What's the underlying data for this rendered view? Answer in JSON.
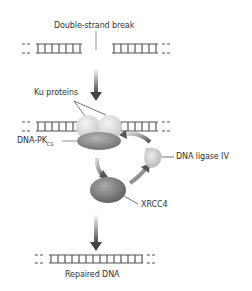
{
  "labels": {
    "break": "Double-strand break",
    "ku": "Ku proteins",
    "dnapk": "DNA-PK",
    "dnapk_sub": "CS",
    "ligase": "DNA ligase IV",
    "xrcc4": "XRCC4",
    "repaired": "Repaired DNA"
  },
  "colors": {
    "strand": "#555555",
    "ku": "#d6d6d6",
    "dnapk": "#8a8a8a",
    "xrcc4": "#7d7d7d",
    "ligase": "#c4c4c4",
    "arrow": "#555555"
  }
}
